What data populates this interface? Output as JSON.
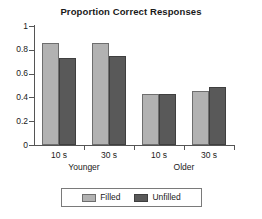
{
  "chart_data": {
    "type": "bar",
    "title": "Proportion Correct Responses",
    "xlabel": "",
    "ylabel": "",
    "ylim": [
      0,
      1
    ],
    "ytick_labels": [
      "1",
      "0.8",
      "0.6",
      "0.4",
      "0.2",
      "0"
    ],
    "ytick_values": [
      1,
      0.8,
      0.6,
      0.4,
      0.2,
      0
    ],
    "grid": false,
    "legend_position": "bottom",
    "categories": [
      "10 s",
      "30 s",
      "10 s",
      "30 s"
    ],
    "group_labels": [
      "Younger",
      "Older"
    ],
    "series": [
      {
        "name": "Filled",
        "color": "#b2b2b2",
        "values": [
          0.86,
          0.86,
          0.43,
          0.45
        ]
      },
      {
        "name": "Unfilled",
        "color": "#595959",
        "values": [
          0.73,
          0.75,
          0.43,
          0.49
        ]
      }
    ],
    "legend": [
      {
        "label": "Filled",
        "color": "#b2b2b2"
      },
      {
        "label": "Unfilled",
        "color": "#595959"
      }
    ]
  }
}
